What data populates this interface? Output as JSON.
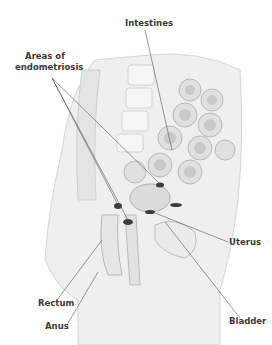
{
  "diagram": {
    "labels": {
      "intestines": "Intestines",
      "endometriosis_line1": "Areas of",
      "endometriosis_line2": "endometriosis",
      "uterus": "Uterus",
      "rectum": "Rectum",
      "bladder": "Bladder",
      "anus": "Anus"
    },
    "colors": {
      "tissue_light": "#f2f2f2",
      "tissue_mid": "#d9d9d9",
      "tissue_dark": "#a9a9a9",
      "lesion": "#3c3c3c",
      "leader_line": "#555555",
      "label_text": "#3a3a3a"
    }
  }
}
